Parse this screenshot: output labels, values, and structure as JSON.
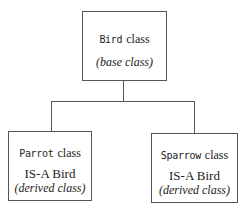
{
  "diagram": {
    "type": "class-inheritance-hierarchy",
    "base": {
      "name_mono": "Bird",
      "name_suffix": "class",
      "note": "(base class)"
    },
    "derived": [
      {
        "name_mono": "Parrot",
        "name_suffix": "class",
        "relation": "IS-A Bird",
        "note": "(derived class)"
      },
      {
        "name_mono": "Sparrow",
        "name_suffix": "class",
        "relation": "IS-A Bird",
        "note": "(derived class)"
      }
    ],
    "colors": {
      "line": "#555555",
      "text": "#222222",
      "background": "#ffffff"
    }
  }
}
